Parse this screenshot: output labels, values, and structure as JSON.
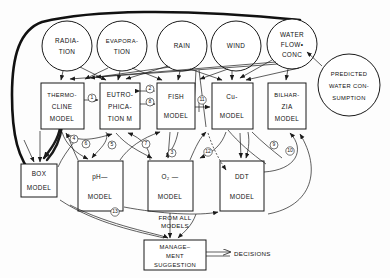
{
  "diagram": {
    "canvas": {
      "width": 390,
      "height": 278
    },
    "colors": {
      "ink": "#1a1a1a",
      "paper": "#ffffff"
    },
    "inputs": [
      {
        "id": "radiation",
        "lines": [
          "RADIA-",
          "TION"
        ],
        "cx": 67,
        "cy": 46,
        "r": 25
      },
      {
        "id": "evaporation",
        "lines": [
          "EVAPORA-",
          "TION"
        ],
        "cx": 122,
        "cy": 46,
        "r": 25
      },
      {
        "id": "rain",
        "lines": [
          "RAIN"
        ],
        "cx": 182,
        "cy": 46,
        "r": 25
      },
      {
        "id": "wind",
        "lines": [
          "WIND"
        ],
        "cx": 236,
        "cy": 46,
        "r": 25
      },
      {
        "id": "water-flow-conc",
        "lines": [
          "WATER",
          "FLOW•",
          "CONC"
        ],
        "cx": 292,
        "cy": 44,
        "r": 25
      }
    ],
    "predicted": {
      "id": "predicted-water-consumption",
      "lines": [
        "PREDICTED",
        "WATER CON-",
        "SUMPTION"
      ],
      "cx": 349,
      "cy": 85,
      "r": 31
    },
    "models_top": [
      {
        "id": "thermocline",
        "lines": [
          "THERMO-",
          "CLINE",
          "MODEL"
        ],
        "x": 41,
        "y": 83,
        "w": 43,
        "h": 46
      },
      {
        "id": "eutrophication",
        "lines": [
          "EUTRO-",
          "PHICA-",
          "TION M"
        ],
        "x": 100,
        "y": 83,
        "w": 40,
        "h": 46
      },
      {
        "id": "fish",
        "lines": [
          "FISH",
          "MODEL"
        ],
        "x": 157,
        "y": 83,
        "w": 38,
        "h": 46
      },
      {
        "id": "copper",
        "lines": [
          "Cu-",
          "MODEL"
        ],
        "x": 212,
        "y": 83,
        "w": 41,
        "h": 46
      },
      {
        "id": "bilharzia",
        "lines": [
          "BILHAR-",
          "ZIA",
          "MODEL"
        ],
        "x": 268,
        "y": 83,
        "w": 38,
        "h": 46
      }
    ],
    "models_bottom": [
      {
        "id": "box",
        "lines": [
          "BOX",
          "MODEL"
        ],
        "x": 21,
        "y": 164,
        "w": 36,
        "h": 33
      },
      {
        "id": "ph",
        "lines": [
          "pH—",
          "MODEL"
        ],
        "x": 78,
        "y": 161,
        "w": 45,
        "h": 50
      },
      {
        "id": "o2",
        "lines": [
          "O₂ —",
          "MODEL"
        ],
        "x": 148,
        "y": 161,
        "w": 45,
        "h": 50
      },
      {
        "id": "ddt",
        "lines": [
          "DDT",
          "MODEL"
        ],
        "x": 220,
        "y": 161,
        "w": 44,
        "h": 50
      }
    ],
    "management": {
      "id": "management-suggestion",
      "lines": [
        "MANAGE–",
        "MENT",
        "SUGGESTION"
      ],
      "x": 144,
      "y": 240,
      "w": 62,
      "h": 30
    },
    "annotations": [
      {
        "id": "from-all-models",
        "lines": [
          "FROM ALL",
          "MODELS"
        ],
        "x": 175,
        "y": 221
      },
      {
        "id": "decisions",
        "text": "DECISIONS",
        "x": 248,
        "y": 254
      }
    ],
    "edge_badges": [
      {
        "label": "1",
        "x": 92,
        "y": 98
      },
      {
        "label": "2",
        "x": 150,
        "y": 91
      },
      {
        "label": "8",
        "x": 150,
        "y": 103
      },
      {
        "label": "11",
        "x": 203,
        "y": 107
      },
      {
        "label": "4",
        "x": 74,
        "y": 139
      },
      {
        "label": "6",
        "x": 84,
        "y": 143
      },
      {
        "label": "5",
        "x": 112,
        "y": 145
      },
      {
        "label": "7",
        "x": 146,
        "y": 144
      },
      {
        "label": "3",
        "x": 172,
        "y": 153
      },
      {
        "label": "12",
        "x": 208,
        "y": 152
      },
      {
        "label": "9",
        "x": 274,
        "y": 145
      },
      {
        "label": "10",
        "x": 290,
        "y": 151
      },
      {
        "label": "13",
        "x": 115,
        "y": 216
      }
    ]
  }
}
